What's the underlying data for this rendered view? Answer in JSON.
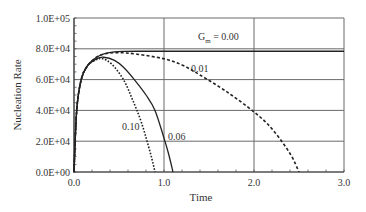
{
  "chart_data": {
    "type": "line",
    "title": "",
    "xlabel": "Time",
    "ylabel": "Nucleation Rate",
    "xlim": [
      0,
      3
    ],
    "ylim": [
      0,
      100000
    ],
    "grid": true,
    "legend": "inline annotations",
    "x_ticks": [
      "0.0",
      "1.0",
      "2.0",
      "3.0"
    ],
    "y_ticks": [
      "0.0E+00",
      "2.0E+04",
      "4.0E+04",
      "6.0E+04",
      "8.0E+04",
      "1.0E+05"
    ],
    "annotation_prefix": "G",
    "annotation_subscript": "m",
    "series": [
      {
        "name": "0.00",
        "label": " = 0.00",
        "style": "solid",
        "x": [
          0,
          0.03,
          0.08,
          0.15,
          0.25,
          0.35,
          0.45,
          0.55,
          0.7,
          1.0,
          1.5,
          2.0,
          2.5,
          3.0
        ],
        "y": [
          0,
          40000,
          60000,
          69000,
          74500,
          77000,
          78000,
          78300,
          78400,
          78400,
          78400,
          78400,
          78400,
          78400
        ]
      },
      {
        "name": "0.01",
        "label": "0.01",
        "style": "dashed",
        "x": [
          0,
          0.03,
          0.08,
          0.15,
          0.25,
          0.35,
          0.5,
          0.7,
          1.0,
          1.2,
          1.4,
          1.7,
          2.0,
          2.2,
          2.4,
          2.5
        ],
        "y": [
          0,
          40000,
          60000,
          69000,
          74500,
          76800,
          77500,
          76500,
          73500,
          69500,
          63000,
          52000,
          39000,
          28000,
          12000,
          0
        ]
      },
      {
        "name": "0.06",
        "label": "0.06",
        "style": "solid",
        "x": [
          0,
          0.03,
          0.08,
          0.15,
          0.25,
          0.33,
          0.45,
          0.55,
          0.67,
          0.8,
          0.9,
          1.0,
          1.05,
          1.1
        ],
        "y": [
          0,
          40000,
          60000,
          69000,
          73500,
          74500,
          72500,
          68000,
          60000,
          50000,
          40000,
          22000,
          12000,
          0
        ]
      },
      {
        "name": "0.10",
        "label": "0.10",
        "style": "dotted",
        "x": [
          0,
          0.03,
          0.08,
          0.15,
          0.25,
          0.32,
          0.42,
          0.55,
          0.65,
          0.75,
          0.85,
          0.9
        ],
        "y": [
          0,
          40000,
          60000,
          69000,
          73000,
          73500,
          70000,
          60000,
          47000,
          32000,
          12000,
          0
        ]
      }
    ]
  },
  "labels": {
    "xlabel": "Time",
    "ylabel": "Nucleation Rate",
    "g_prefix": "G",
    "g_sub": "m",
    "g_value": " = 0.00",
    "s001": "0.01",
    "s006": "0.06",
    "s010": "0.10"
  }
}
